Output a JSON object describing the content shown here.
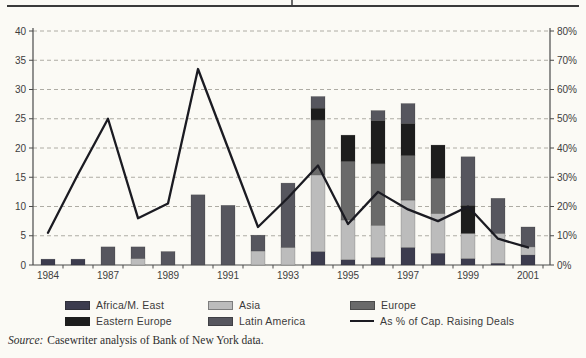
{
  "source": {
    "prefix": "Source:",
    "text": "Casewriter analysis of Bank of New York data."
  },
  "chart_data": {
    "type": "bar",
    "subtype": "stacked-column-with-line",
    "title": "",
    "grid": "dashed-horizontal",
    "left_axis": {
      "min": 0,
      "max": 40,
      "step": 5,
      "tick_labels": [
        "0",
        "5",
        "10",
        "15",
        "20",
        "25",
        "30",
        "35",
        "40"
      ]
    },
    "right_axis": {
      "min": 0,
      "max": 80,
      "step": 10,
      "suffix": "%",
      "tick_labels": [
        "0%",
        "10%",
        "20%",
        "30%",
        "40%",
        "50%",
        "60%",
        "70%",
        "80%"
      ]
    },
    "x_tick_labels": [
      "1984",
      "1987",
      "1989",
      "1991",
      "1993",
      "1995",
      "1997",
      "1999",
      "2001"
    ],
    "categories": [
      "1984",
      "1986",
      "1987",
      "1988",
      "1989",
      "1990",
      "1991",
      "1992",
      "1993",
      "1994",
      "1995",
      "1996",
      "1997",
      "1998",
      "1999",
      "2000",
      "2001"
    ],
    "label_every_other_bar": true,
    "series": [
      {
        "name": "Africa/M. East",
        "color": "#3c3c4e",
        "values": [
          1.0,
          1.0,
          0,
          0,
          0,
          0,
          0,
          0,
          0,
          2.3,
          0.9,
          1.3,
          3.0,
          2.0,
          1.1,
          0.3,
          1.7
        ]
      },
      {
        "name": "Asia",
        "color": "#bcbcbc",
        "values": [
          0,
          0,
          0,
          1.1,
          0,
          0,
          0,
          2.4,
          3.0,
          13.1,
          6.8,
          5.5,
          8.1,
          6.8,
          4.3,
          5.1,
          1.4
        ]
      },
      {
        "name": "Europe",
        "color": "#6a6a6a",
        "values": [
          0,
          0,
          0,
          0,
          0,
          0,
          0,
          0,
          0,
          9.4,
          10.0,
          10.5,
          7.6,
          6.0,
          0,
          0,
          0
        ]
      },
      {
        "name": "Eastern Europe",
        "color": "#1d1d1d",
        "values": [
          0,
          0,
          0,
          0,
          0,
          0,
          0,
          0,
          0,
          2.0,
          4.5,
          7.4,
          5.5,
          5.7,
          4.8,
          0,
          0
        ]
      },
      {
        "name": "Latin America",
        "color": "#56565e",
        "values": [
          0,
          0,
          3.1,
          2.0,
          2.3,
          12.0,
          10.2,
          2.7,
          11.0,
          2.0,
          0,
          1.7,
          3.4,
          0,
          8.3,
          6.0,
          3.4
        ]
      }
    ],
    "bar_totals": [
      1.0,
      1.0,
      3.1,
      3.1,
      2.3,
      12.0,
      10.2,
      5.1,
      14.0,
      28.8,
      22.2,
      26.4,
      27.6,
      20.5,
      18.5,
      11.4,
      6.5
    ],
    "line_series": {
      "name": "As % of Cap. Raising Deals",
      "color": "#1b1b22",
      "values_pct": [
        11,
        31,
        50,
        16,
        21,
        67,
        40,
        13,
        23,
        34,
        14,
        25,
        19,
        15,
        20,
        9,
        6
      ]
    },
    "legend": [
      {
        "label": "Africa/M. East",
        "swatch": "africa",
        "type": "swatch",
        "col": 0,
        "row": 0
      },
      {
        "label": "Asia",
        "swatch": "asia",
        "type": "swatch",
        "col": 1,
        "row": 0
      },
      {
        "label": "Europe",
        "swatch": "europe",
        "type": "swatch",
        "col": 2,
        "row": 0
      },
      {
        "label": "Eastern Europe",
        "swatch": "eastern-europe",
        "type": "swatch",
        "col": 0,
        "row": 1
      },
      {
        "label": "Latin America",
        "swatch": "latin-america",
        "type": "swatch",
        "col": 1,
        "row": 1
      },
      {
        "label": "As % of Cap. Raising Deals",
        "swatch": "line",
        "type": "line",
        "col": 2,
        "row": 1
      }
    ],
    "legend_position": "bottom"
  }
}
